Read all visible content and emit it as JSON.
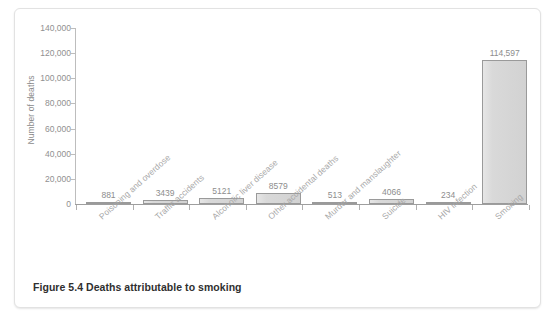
{
  "caption": "Figure 5.4   Deaths attributable to smoking",
  "chart_data": {
    "type": "bar",
    "title": "Deaths attributable to smoking",
    "xlabel": "",
    "ylabel": "Number of deaths",
    "ylim": [
      0,
      140000
    ],
    "yticks": [
      "0",
      "20,000",
      "40,000",
      "60,000",
      "80,000",
      "100,000",
      "120,000",
      "140,000"
    ],
    "ytick_values": [
      0,
      20000,
      40000,
      60000,
      80000,
      100000,
      120000,
      140000
    ],
    "grid": false,
    "legend": null,
    "categories": [
      "Poisoning and overdose",
      "Traffic accidents",
      "Alcoholic liver disease",
      "Other accidental deaths",
      "Murder and manslaughter",
      "Suicide",
      "HIV infection",
      "Smoking"
    ],
    "values": [
      881,
      3439,
      5121,
      8579,
      513,
      4066,
      234,
      114597
    ],
    "value_labels": [
      "881",
      "3439",
      "5121",
      "8579",
      "513",
      "4066",
      "234",
      "114,597"
    ],
    "bar_fill": "#d9d9d9",
    "bar_border": "#9a9a9a"
  }
}
